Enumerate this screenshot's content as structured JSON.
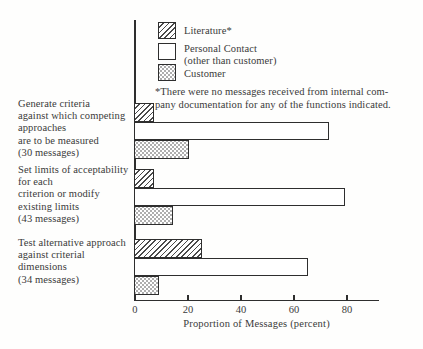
{
  "legend": {
    "items": [
      {
        "label": "Literature*",
        "pattern": "diagonal-hatch"
      },
      {
        "label": "Personal Contact",
        "sublabel": "(other than customer)",
        "pattern": "plain"
      },
      {
        "label": "Customer",
        "pattern": "stipple"
      }
    ]
  },
  "footnote": {
    "line1": "*There were no messages received from internal com-",
    "line2": "pany documentation for any of the functions indicated."
  },
  "chart_data": {
    "type": "bar",
    "orientation": "horizontal",
    "xlabel": "Proportion of Messages (percent)",
    "xlim": [
      0,
      91
    ],
    "xticks": [
      0,
      20,
      40,
      60,
      80
    ],
    "grid": false,
    "legend_position": "top",
    "ink_color": "#2e2e2e",
    "categories": [
      {
        "label_lines": [
          "Generate criteria",
          "against which competing",
          "approaches",
          "are to be measured",
          "(30 messages)"
        ]
      },
      {
        "label_lines": [
          "Set limits of acceptability",
          "for each",
          "criterion or modify",
          "existing limits",
          "(43 messages)"
        ]
      },
      {
        "label_lines": [
          "Test alternative approach",
          "against criterial",
          "dimensions",
          "(34 messages)"
        ]
      }
    ],
    "series": [
      {
        "name": "Literature*",
        "pattern": "diagonal-hatch",
        "values": [
          7,
          7,
          25
        ]
      },
      {
        "name": "Personal Contact (other than customer)",
        "pattern": "plain",
        "values": [
          73,
          79,
          65
        ]
      },
      {
        "name": "Customer",
        "pattern": "stipple",
        "values": [
          20,
          14,
          9
        ]
      }
    ]
  }
}
